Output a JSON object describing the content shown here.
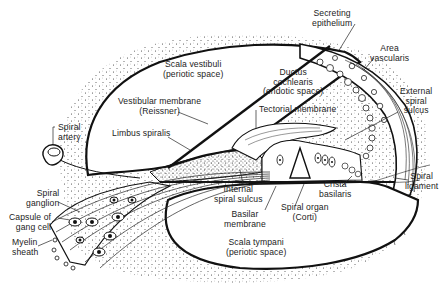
{
  "diagram": {
    "labels": {
      "scala_vestibuli": [
        "Scala vestibuli",
        "(periotic space)"
      ],
      "ductus_cochlearis": [
        "Ductus",
        "cochlearis",
        "(endotic space)"
      ],
      "secreting_epithelium": [
        "Secreting",
        "epithelium"
      ],
      "area_vascularis": [
        "Area",
        "vascularis"
      ],
      "external_spiral_sulcus": [
        "External",
        "spiral",
        "sulcus"
      ],
      "vestibular_membrane": [
        "Vestibular membrane",
        "(Reissner)"
      ],
      "tectorial_membrane": [
        "Tectorial membrane"
      ],
      "limbus_spiralis": [
        "Limbus spiralis"
      ],
      "spiral_artery": [
        "Spiral",
        "artery"
      ],
      "spiral_ganglion": [
        "Spiral",
        "ganglion"
      ],
      "capsule_of_gang_cell": [
        "Capsule of",
        "gang cell"
      ],
      "myelin_sheath": [
        "Myelin",
        "sheath"
      ],
      "internal_spiral_sulcus": [
        "Internal",
        "spiral sulcus"
      ],
      "basilar_membrane": [
        "Basilar",
        "membrane"
      ],
      "crista_basilaris": [
        "Crista",
        "basilaris"
      ],
      "spiral_organ": [
        "Spiral organ",
        "(Corti)"
      ],
      "spiral_ligament": [
        "Spiral",
        "ligament"
      ],
      "scala_tympani": [
        "Scala tympani",
        "(periotic space)"
      ]
    },
    "colors": {
      "ink": "#1a1a1a",
      "background": "#ffffff",
      "stipple": "#3a3a3a"
    }
  }
}
